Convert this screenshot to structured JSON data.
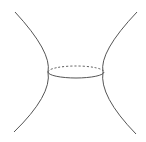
{
  "diagram": {
    "title": "Hyperboloid neck with throat circle",
    "stroke_color": "#555555",
    "background": "#ffffff",
    "left_curve": {
      "d": "M15,12 Q52,52 48,72 Q52,95 14,132"
    },
    "right_curve": {
      "d": "M137,12 Q99,52 103,72 Q99,96 136,134"
    },
    "throat_ellipse": {
      "cx": 76,
      "cy": 72,
      "rx": 28,
      "ry": 6,
      "front_style": "solid",
      "back_style": "dashed"
    }
  }
}
